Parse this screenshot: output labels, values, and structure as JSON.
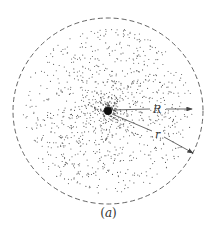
{
  "figure": {
    "caption": "(a)",
    "caption_letter": "a",
    "labels": {
      "R": "R",
      "r": "r"
    },
    "colors": {
      "background": "#ffffff",
      "ink": "#444444",
      "dash": "#666666"
    },
    "geometry": {
      "center": [
        108,
        111
      ],
      "outer_radius_x": 95,
      "outer_radius_y": 93,
      "cloud_radius": 85,
      "R_arrow_end": [
        192,
        109
      ],
      "r_arrow_end": [
        193,
        153
      ]
    }
  }
}
